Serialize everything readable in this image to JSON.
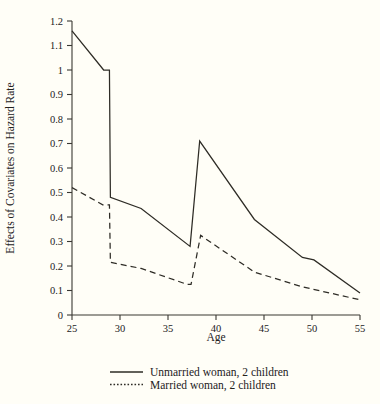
{
  "chart_data": {
    "type": "line",
    "title": "",
    "xlabel": "Age",
    "ylabel": "Effects of Covariates on Hazard Rate",
    "xlim": [
      25,
      55
    ],
    "ylim": [
      0,
      1.2
    ],
    "grid": false,
    "legend_position": "below-axis",
    "xticks": [
      25,
      30,
      35,
      40,
      45,
      50,
      55
    ],
    "xtick_labels": [
      "25",
      "30",
      "35",
      "40",
      "45",
      "50",
      "55"
    ],
    "yticks": [
      0,
      0.1,
      0.2,
      0.3,
      0.4,
      0.5,
      0.6,
      0.7,
      0.8,
      0.9,
      1,
      1.1,
      1.2
    ],
    "ytick_labels": [
      "0",
      "0.1",
      "0.2",
      "0.3",
      "0.4",
      "0.5",
      "0.6",
      "0.7",
      "0.8",
      "0.9",
      "1",
      "1.1",
      "1.2"
    ],
    "series": [
      {
        "name": "Unmarried woman, 2 children",
        "style": "solid",
        "x": [
          25.0,
          28.3,
          28.9,
          29.0,
          32.2,
          37.3,
          38.3,
          44.0,
          49.0,
          50.2,
          55.0
        ],
        "y": [
          1.16,
          1.0,
          1.0,
          0.48,
          0.435,
          0.28,
          0.71,
          0.39,
          0.235,
          0.225,
          0.09
        ]
      },
      {
        "name": "Married woman, 2 children",
        "style": "dashed",
        "x": [
          25.0,
          28.2,
          28.9,
          29.0,
          32.2,
          37.0,
          37.4,
          38.4,
          44.0,
          49.0,
          55.0
        ],
        "y": [
          0.52,
          0.45,
          0.45,
          0.215,
          0.19,
          0.125,
          0.125,
          0.325,
          0.175,
          0.115,
          0.062
        ]
      }
    ],
    "legend_entries": [
      {
        "marker": "solid-line",
        "label": "Unmarried woman, 2 children"
      },
      {
        "marker": "dotted-line",
        "label": "Married woman, 2 children"
      }
    ],
    "colors": {
      "background": "#fffef7",
      "axis": "#3a3833",
      "line": "#2e2c26",
      "text": "#23211c"
    }
  }
}
